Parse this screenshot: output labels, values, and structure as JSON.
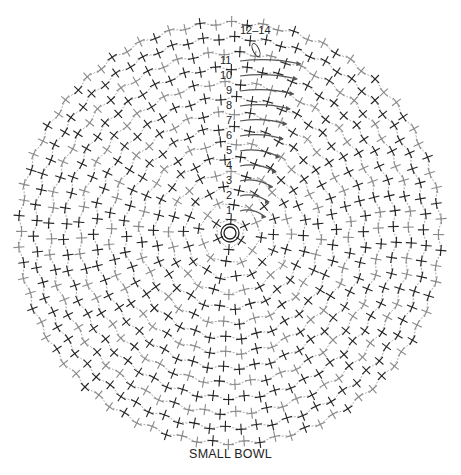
{
  "diagram": {
    "title": "SMALL BOWL",
    "type": "crochet stitch chart",
    "center": {
      "x": 230,
      "y": 233
    },
    "rounds_count": 14,
    "round_spacing_px": 15,
    "stitch_symbol": "single-crochet-cross",
    "start_symbol": "magic-ring",
    "round_labels": [
      {
        "label": "1",
        "round": 1
      },
      {
        "label": "2",
        "round": 2
      },
      {
        "label": "3",
        "round": 3
      },
      {
        "label": "4",
        "round": 4
      },
      {
        "label": "5",
        "round": 5
      },
      {
        "label": "6",
        "round": 6
      },
      {
        "label": "7",
        "round": 7
      },
      {
        "label": "8",
        "round": 8
      },
      {
        "label": "9",
        "round": 9
      },
      {
        "label": "10",
        "round": 10
      },
      {
        "label": "11",
        "round": 11
      },
      {
        "label": "12–14",
        "round": 13
      }
    ],
    "colors": {
      "stitch_dark": "#222222",
      "stitch_light": "#8a8a8a",
      "arrow": "#555555",
      "background": "#ffffff"
    }
  }
}
